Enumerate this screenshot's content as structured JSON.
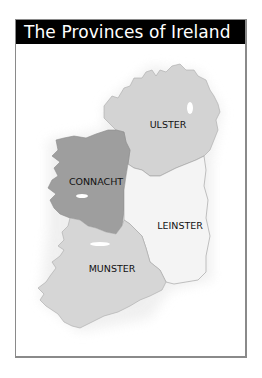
{
  "title": "The Provinces of Ireland",
  "colors": {
    "title_bg": "#000000",
    "title_text": "#ffffff",
    "frame_border": "#8a8a8a",
    "ulster": "#d3d3d3",
    "connacht": "#9e9e9e",
    "leinster": "#f4f4f4",
    "munster": "#d6d6d6",
    "outline": "#9a9a9a"
  },
  "provinces": [
    {
      "name": "ULSTER",
      "label_x": 168,
      "label_y": 128
    },
    {
      "name": "CONNACHT",
      "label_x": 96,
      "label_y": 185
    },
    {
      "name": "LEINSTER",
      "label_x": 180,
      "label_y": 229
    },
    {
      "name": "MUNSTER",
      "label_x": 112,
      "label_y": 272
    }
  ]
}
